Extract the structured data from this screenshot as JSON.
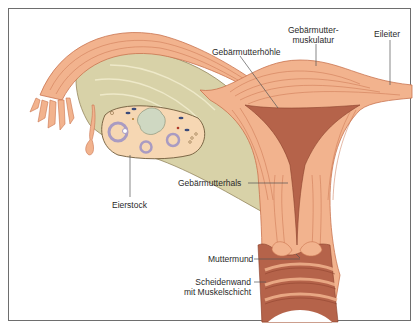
{
  "figure": {
    "labels": {
      "muskulatur_line1": "Gebärmutter-",
      "muskulatur_line2": "muskulatur",
      "eileiter": "Eileiter",
      "hoehle": "Gebärmutterhöhle",
      "eierstock": "Eierstock",
      "hals": "Gebärmutterhals",
      "muttermund": "Muttermund",
      "scheidenwand_line1": "Scheidenwand",
      "scheidenwand_line2": "mit Muskelschicht"
    },
    "colors": {
      "muscle": "#f2b38e",
      "muscle_line": "#c9734f",
      "cavity": "#b5634a",
      "ligament": "#d8d2a8",
      "ovary": "#f6d7b3",
      "follicle": "#a99bc2",
      "frame": "#6e6e6e"
    }
  }
}
